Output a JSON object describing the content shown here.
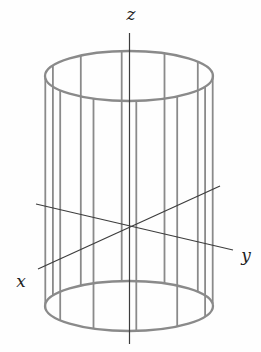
{
  "figure": {
    "background": "#fefefe"
  },
  "labels": {
    "x": {
      "text": "x",
      "x": 21,
      "y": 287
    },
    "y": {
      "text": "y",
      "x": 246,
      "y": 261
    },
    "z": {
      "text": "z",
      "x": 131,
      "y": 20
    }
  },
  "colors": {
    "cylinder_stroke": "#8a8a8a",
    "axis_stroke": "#3d3d3d",
    "label_color": "#1f1f1f"
  },
  "geometry": {
    "cylinder": {
      "cx": 129,
      "rx": 84,
      "ry": 25,
      "top_cy": 76,
      "bottom_cy": 306,
      "ruling_count": 12,
      "phase_deg": -5,
      "ellipse_stroke_width": 2.3,
      "ruling_stroke_width": 1.8
    },
    "axes": [
      {
        "name": "z-axis-line",
        "x1": 129.5,
        "y1": 33,
        "x2": 129.5,
        "y2": 344
      },
      {
        "name": "x-axis-line",
        "x1": 220,
        "y1": 186,
        "x2": 38,
        "y2": 269
      },
      {
        "name": "y-axis-line",
        "x1": 36,
        "y1": 204,
        "x2": 233,
        "y2": 250
      }
    ],
    "axis_stroke_width": 1.2
  }
}
